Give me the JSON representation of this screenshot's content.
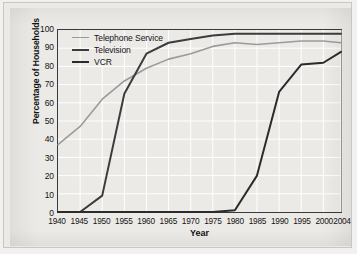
{
  "chart_data": {
    "type": "line",
    "title": "",
    "xlabel": "Year",
    "ylabel": "Percentage of Households",
    "xlim": [
      1940,
      2004
    ],
    "ylim": [
      0,
      100
    ],
    "grid": true,
    "legend_position": "top-left",
    "xticks": [
      1940,
      1945,
      1950,
      1955,
      1960,
      1965,
      1970,
      1975,
      1980,
      1985,
      1990,
      1995,
      2000,
      2004
    ],
    "xtick_labels": [
      "1940",
      "1945",
      "1950",
      "1955",
      "1960",
      "1965",
      "1970",
      "1975",
      "1980",
      "1985",
      "1990",
      "1995",
      "2000",
      "2004"
    ],
    "yticks": [
      0,
      10,
      20,
      30,
      40,
      50,
      60,
      70,
      80,
      90,
      100
    ],
    "ytick_labels": [
      "0",
      "10",
      "20",
      "30",
      "40",
      "50",
      "60",
      "70",
      "80",
      "90",
      "100"
    ],
    "x": [
      1940,
      1945,
      1950,
      1955,
      1960,
      1965,
      1970,
      1975,
      1980,
      1985,
      1990,
      1995,
      2000,
      2004
    ],
    "series": [
      {
        "name": "Telephone Service",
        "color": "#9b9b9b",
        "width": 1.6,
        "values": [
          37,
          47,
          62,
          72,
          79,
          84,
          87,
          91,
          93,
          92,
          93,
          94,
          94,
          93
        ]
      },
      {
        "name": "Television",
        "color": "#3c3c3c",
        "width": 2.0,
        "values": [
          0,
          0,
          9,
          65,
          87,
          93,
          95,
          97,
          98,
          98,
          98,
          98,
          98,
          98
        ]
      },
      {
        "name": "VCR",
        "color": "#2b2b2b",
        "width": 2.0,
        "values": [
          0,
          0,
          0,
          0,
          0,
          0,
          0,
          0,
          1,
          20,
          66,
          81,
          82,
          88
        ]
      }
    ]
  },
  "legend": {
    "items": [
      {
        "label": "Telephone Service",
        "color": "#9b9b9b",
        "width": 1.6
      },
      {
        "label": "Television",
        "color": "#3c3c3c",
        "width": 2.0
      },
      {
        "label": "VCR",
        "color": "#2b2b2b",
        "width": 2.0
      }
    ]
  },
  "axes": {
    "x_title": "Year",
    "y_title": "Percentage of Households"
  },
  "colors": {
    "background": "#eceae7",
    "frame": "#3a3a3a",
    "grid": "#ffffff",
    "text": "#141414"
  }
}
